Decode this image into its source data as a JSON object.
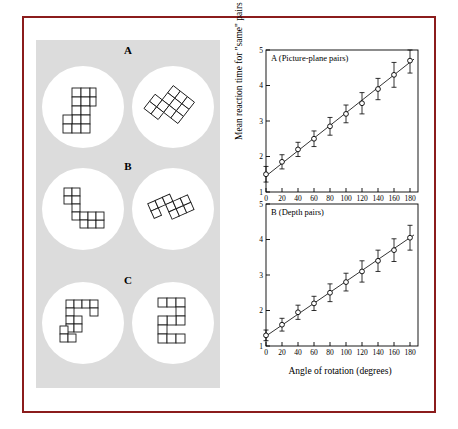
{
  "figure": {
    "border_color": "#8b1c1c",
    "panel_background": "#dcdcdc",
    "disc_background": "#ffffff"
  },
  "stimuli": {
    "blocks": [
      {
        "label": "A",
        "type": "picture-plane-pair"
      },
      {
        "label": "B",
        "type": "depth-pair"
      },
      {
        "label": "C",
        "type": "different-pair"
      }
    ]
  },
  "chart_data": [
    {
      "type": "line",
      "title": "A (Picture-plane pairs)",
      "xlabel": "Angle of rotation (degrees)",
      "ylabel": "Mean reaction time for \"same\" pairs (seconds)",
      "xlim": [
        0,
        190
      ],
      "ylim": [
        1,
        5
      ],
      "xticks": [
        0,
        20,
        40,
        60,
        80,
        100,
        120,
        140,
        160,
        180
      ],
      "yticks": [
        1,
        2,
        3,
        4,
        5
      ],
      "grid": false,
      "legend": "none",
      "x": [
        0,
        20,
        40,
        60,
        80,
        100,
        120,
        140,
        160,
        180
      ],
      "values": [
        1.5,
        1.85,
        2.2,
        2.5,
        2.85,
        3.2,
        3.5,
        3.9,
        4.3,
        4.7
      ],
      "errors": [
        0.22,
        0.2,
        0.2,
        0.22,
        0.25,
        0.25,
        0.3,
        0.3,
        0.35,
        0.35
      ],
      "fit_line": {
        "intercept": 1.45,
        "slope_per_degree": 0.0178
      }
    },
    {
      "type": "line",
      "title": "B (Depth pairs)",
      "xlabel": "Angle of rotation (degrees)",
      "ylabel": "Mean reaction time for \"same\" pairs (seconds)",
      "xlim": [
        0,
        190
      ],
      "ylim": [
        1,
        5
      ],
      "xticks": [
        0,
        20,
        40,
        60,
        80,
        100,
        120,
        140,
        160,
        180
      ],
      "yticks": [
        1,
        2,
        3,
        4,
        5
      ],
      "grid": false,
      "legend": "none",
      "x": [
        0,
        20,
        40,
        60,
        80,
        100,
        120,
        140,
        160,
        180
      ],
      "values": [
        1.3,
        1.6,
        1.95,
        2.2,
        2.5,
        2.8,
        3.1,
        3.4,
        3.7,
        4.05
      ],
      "errors": [
        0.15,
        0.18,
        0.2,
        0.2,
        0.25,
        0.25,
        0.3,
        0.3,
        0.32,
        0.35
      ],
      "fit_line": {
        "intercept": 1.28,
        "slope_per_degree": 0.0154
      }
    }
  ],
  "axes": {
    "ylabel": "Mean reaction time for \"same\" pairs (seconds)",
    "xlabel": "Angle of rotation (degrees)",
    "panel_a_title": "A (Picture-plane pairs)",
    "panel_b_title": "B (Depth pairs)"
  }
}
